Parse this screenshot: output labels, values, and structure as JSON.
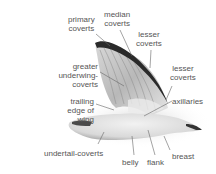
{
  "diagram": {
    "labels": {
      "primary_coverts": [
        "primary",
        "coverts"
      ],
      "median_coverts": [
        "median",
        "coverts"
      ],
      "lesser_coverts_upper": [
        "lesser",
        "coverts"
      ],
      "greater_underwing_coverts": [
        "greater",
        "underwing-",
        "coverts"
      ],
      "lesser_coverts_right": [
        "lesser",
        "coverts"
      ],
      "trailing_edge_of_wing": [
        "trailing",
        "edge of",
        "wing"
      ],
      "axillaries": "axillaries",
      "undertail_coverts": "undertail-coverts",
      "belly": "belly",
      "flank": "flank",
      "breast": "breast"
    },
    "colors": {
      "label_text": "#555555",
      "leader_line": "#666666",
      "wing_dark": "#222222",
      "wing_mid": "#9a9a9a",
      "body_light": "#e4e4e4"
    }
  }
}
